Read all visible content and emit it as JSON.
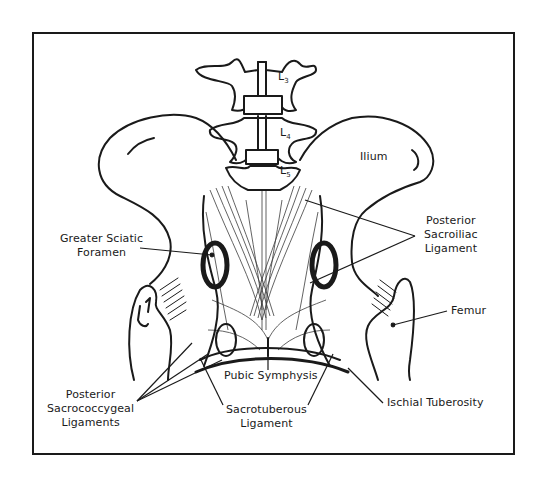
{
  "figure": {
    "colors": {
      "ink": "#1a1a1a",
      "background": "#ffffff",
      "frame": "#1a1a1a"
    }
  },
  "vertebrae": [
    {
      "letter": "L",
      "index": "3"
    },
    {
      "letter": "L",
      "index": "4"
    },
    {
      "letter": "L",
      "index": "5"
    }
  ],
  "labels": {
    "ilium": "Ilium",
    "greater_sciatic": {
      "line1": "Greater Sciatic",
      "line2": "Foramen"
    },
    "posterior_sacroiliac": {
      "line1": "Posterior",
      "line2": "Sacroiliac",
      "line3": "Ligament"
    },
    "femur": "Femur",
    "pubic_symphysis": "Pubic Symphysis",
    "ischial_tuberosity": "Ischial Tuberosity",
    "posterior_sacrococcygeal": {
      "line1": "Posterior",
      "line2": "Sacrococcygeal",
      "line3": "Ligaments"
    },
    "sacrotuberous": {
      "line1": "Sacrotuberous",
      "line2": "Ligament"
    }
  }
}
